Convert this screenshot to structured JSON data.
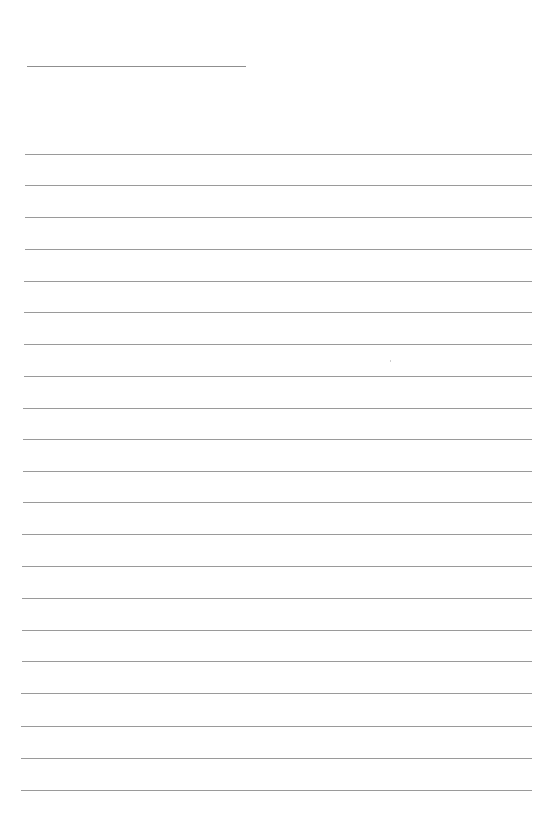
{
  "page": {
    "type": "lined-writing-sheet",
    "background_color": "#ffffff",
    "line_color": "#9a9a9a"
  },
  "title_line": {
    "x1": 27,
    "x2": 246,
    "y": 66
  },
  "writing_lines": [
    {
      "y": 154,
      "x1": 25,
      "x2": 532
    },
    {
      "y": 185,
      "x1": 25,
      "x2": 532
    },
    {
      "y": 217,
      "x1": 25,
      "x2": 532
    },
    {
      "y": 249,
      "x1": 25,
      "x2": 532
    },
    {
      "y": 281,
      "x1": 24,
      "x2": 532
    },
    {
      "y": 312,
      "x1": 24,
      "x2": 532
    },
    {
      "y": 344,
      "x1": 24,
      "x2": 532
    },
    {
      "y": 376,
      "x1": 24,
      "x2": 532
    },
    {
      "y": 408,
      "x1": 23,
      "x2": 532
    },
    {
      "y": 439,
      "x1": 23,
      "x2": 532
    },
    {
      "y": 471,
      "x1": 23,
      "x2": 532
    },
    {
      "y": 502,
      "x1": 23,
      "x2": 532
    },
    {
      "y": 534,
      "x1": 22,
      "x2": 532
    },
    {
      "y": 566,
      "x1": 22,
      "x2": 532
    },
    {
      "y": 598,
      "x1": 22,
      "x2": 532
    },
    {
      "y": 630,
      "x1": 22,
      "x2": 532
    },
    {
      "y": 661,
      "x1": 22,
      "x2": 532
    },
    {
      "y": 693,
      "x1": 21,
      "x2": 532
    },
    {
      "y": 726,
      "x1": 21,
      "x2": 532
    },
    {
      "y": 758,
      "x1": 21,
      "x2": 532
    },
    {
      "y": 790,
      "x1": 21,
      "x2": 532
    }
  ],
  "line_count": 21
}
